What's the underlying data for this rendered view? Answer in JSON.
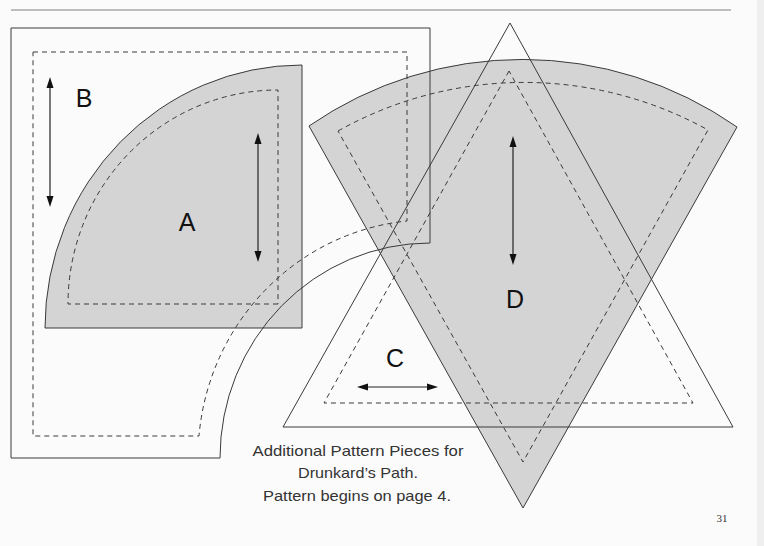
{
  "page": {
    "number": "31",
    "caption_lines": [
      "Additional Pattern Pieces for",
      "Drunkard’s Path.",
      "Pattern begins on page 4."
    ]
  },
  "pieces": [
    {
      "id": "A",
      "label": "A",
      "shape": "quarter-circle",
      "shaded": true,
      "grain_arrow": "vertical"
    },
    {
      "id": "B",
      "label": "B",
      "shape": "square-minus-quarter-circle",
      "shaded": false,
      "grain_arrow": "vertical"
    },
    {
      "id": "C",
      "label": "C",
      "shape": "triangle",
      "shaded": false,
      "grain_arrow": "horizontal"
    },
    {
      "id": "D",
      "label": "D",
      "shape": "wedge",
      "shaded": true,
      "grain_arrow": "vertical"
    }
  ],
  "legend": {
    "cutting_line": "solid",
    "sewing_line": "dashed"
  },
  "colors": {
    "shaded_piece": "#d4d4d4",
    "line": "#3a3a3a",
    "background": "#fbfbfb"
  }
}
